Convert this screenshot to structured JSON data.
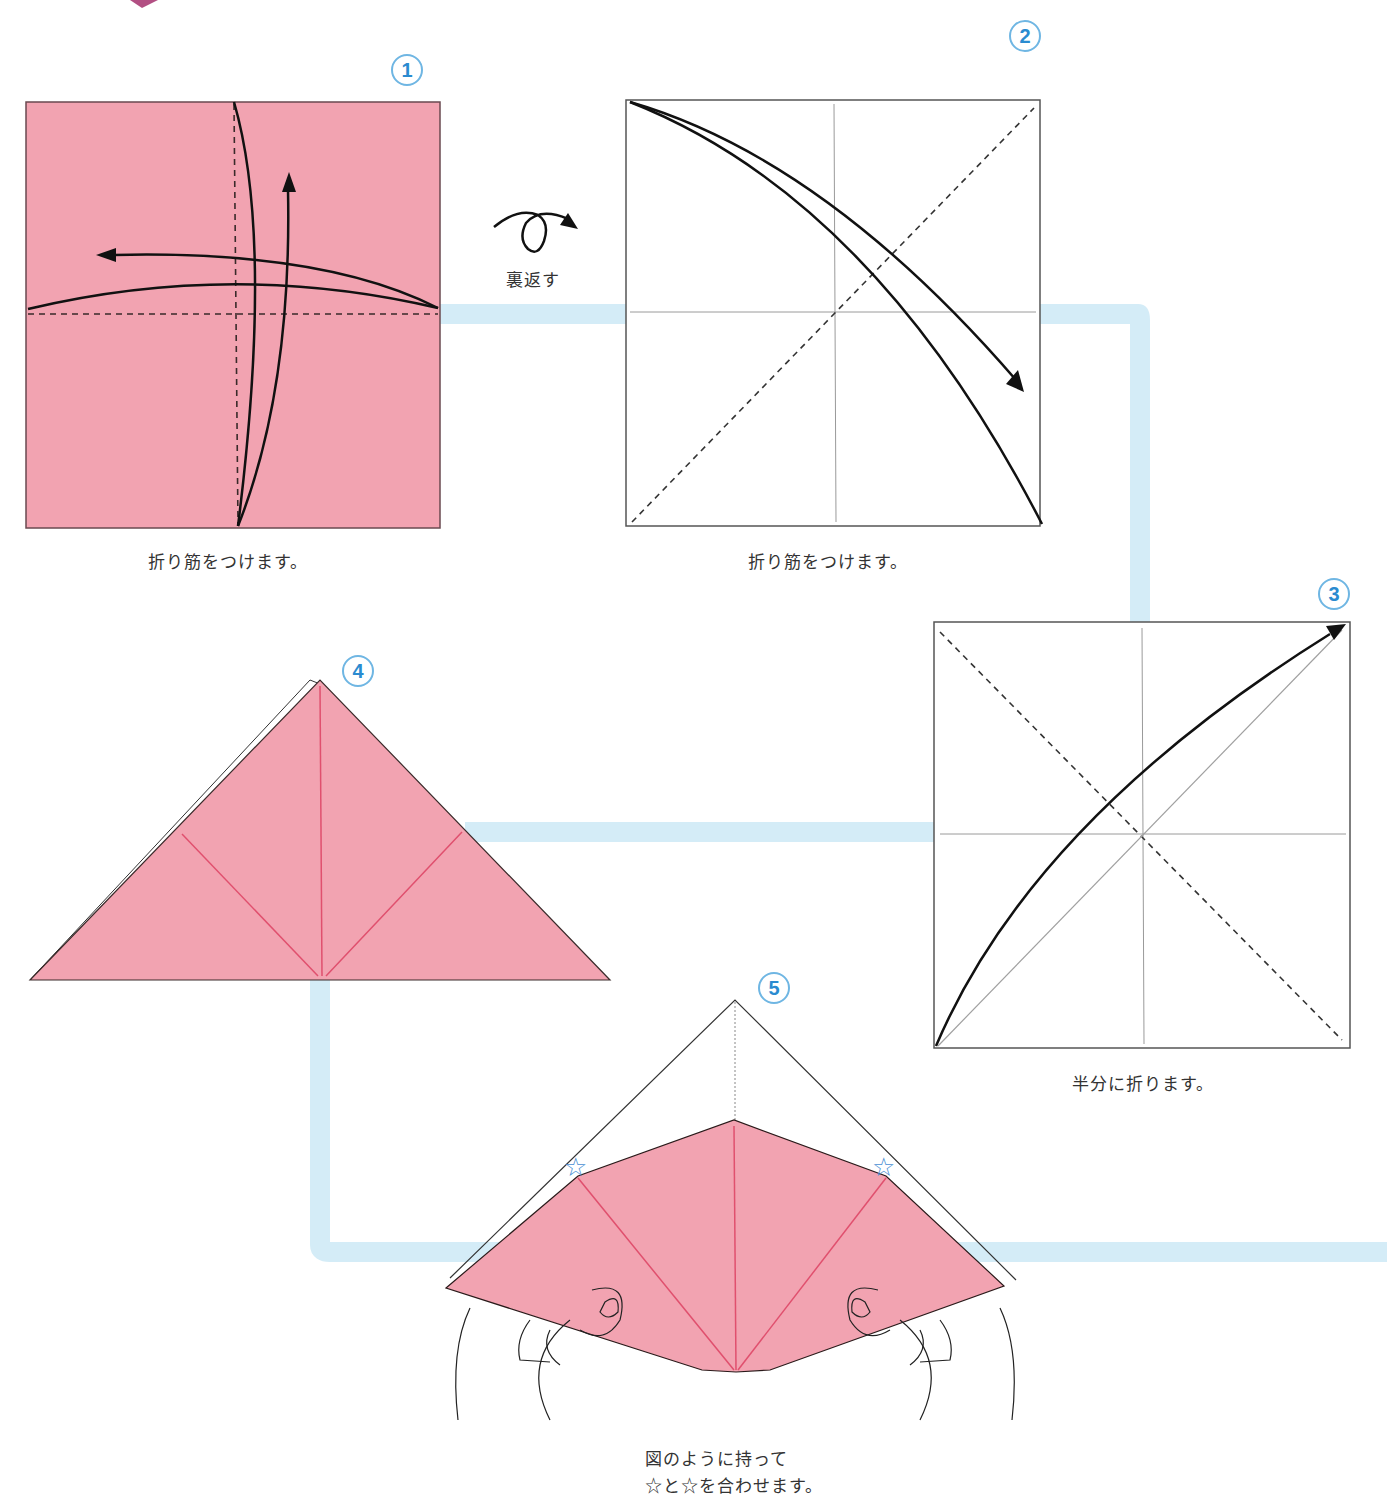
{
  "colors": {
    "paper_pink": "#f2a3b1",
    "crease_red": "#e0506e",
    "flow_path": "#d4ecf7",
    "badge_blue": "#2a8bd0",
    "badge_ring": "#6fb6e3",
    "line": "#1a1a1a",
    "star": "#4a8fd4"
  },
  "steps": [
    {
      "number": "1",
      "caption": "折り筋をつけます。",
      "figure": "pink square, dashed vertical and horizontal center creases, curved arrows folding in half both ways"
    },
    {
      "number": "2",
      "caption": "折り筋をつけます。",
      "figure": "white square, gray center creases, dashed diagonal, curved arrow folding top-left corner to bottom-right"
    },
    {
      "number": "3",
      "caption": "半分に折ります。",
      "figure": "white square, gray creases, dashed diagonal, curved arrow folding bottom-left corner to top-right"
    },
    {
      "number": "4",
      "caption": "",
      "figure": "pink triangle with red crease lines from bottom center"
    },
    {
      "number": "5",
      "caption_lines": [
        "図のように持って",
        "☆と☆を合わせます。"
      ],
      "figure": "hands holding pink triangle, two star markers on edges"
    }
  ],
  "turn_over": {
    "label": "裏返す",
    "icon": "flip-over-arrow-icon"
  },
  "star_marker": "☆"
}
